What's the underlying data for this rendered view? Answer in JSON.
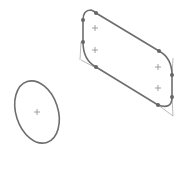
{
  "canvas": {
    "width": 186,
    "height": 172,
    "background": "#ffffff"
  },
  "colors": {
    "stroke": "#6e6e6e",
    "construction": "#a8a8a8",
    "marker": "#8a8a8a",
    "vertex": "#666666"
  },
  "shapes": {
    "slot": {
      "path": "M 83 20 Q 83 10 91 10 Q 94 11 96 13 L 159 51 Q 172 58 172 75 L 172 97 Q 172 110 158 105 L 96 67 Q 83 60 83 42 Z",
      "vertices": [
        [
          83,
          20
        ],
        [
          96,
          13
        ],
        [
          159,
          51
        ],
        [
          172,
          75
        ],
        [
          172,
          97
        ],
        [
          158,
          105
        ],
        [
          96,
          67
        ],
        [
          83,
          42
        ]
      ],
      "construction_lines": [
        [
          81,
          60,
          96,
          68
        ],
        [
          81,
          42,
          80,
          60
        ],
        [
          173,
          58,
          172,
          75
        ],
        [
          172,
          97,
          173,
          116
        ],
        [
          158,
          105,
          173,
          116
        ]
      ],
      "markers": [
        [
          95,
          28
        ],
        [
          95,
          50
        ],
        [
          158,
          67
        ],
        [
          158,
          88
        ]
      ]
    },
    "ellipse": {
      "cx": 37,
      "cy": 112,
      "rx": 21,
      "ry": 32,
      "rotate": -18,
      "marker": [
        37,
        112
      ]
    }
  }
}
